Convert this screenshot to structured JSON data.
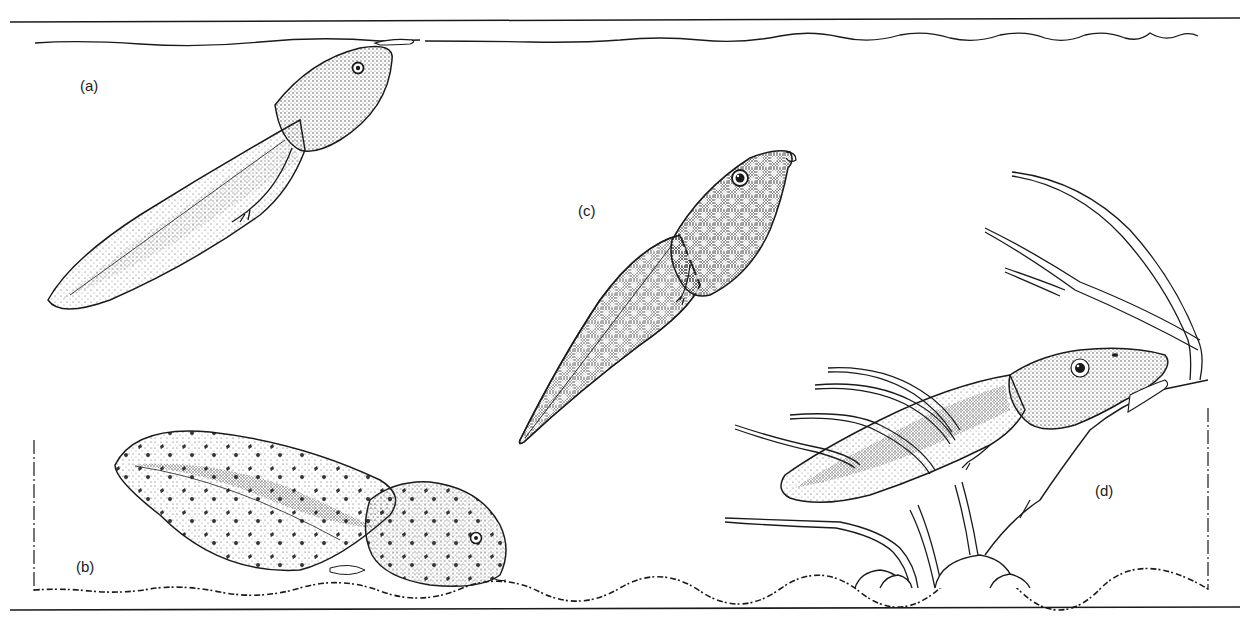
{
  "figure": {
    "labels": {
      "a": "(a)",
      "b": "(b)",
      "c": "(c)",
      "d": "(d)"
    },
    "panels": [
      {
        "id": "a",
        "subject": "tadpole-hanging-from-surface",
        "position": "upper-left"
      },
      {
        "id": "b",
        "subject": "tadpole-resting-on-bottom",
        "position": "lower-left"
      },
      {
        "id": "c",
        "subject": "tadpole-mid-water",
        "position": "center"
      },
      {
        "id": "d",
        "subject": "tadpole-clinging-to-rock-among-plants",
        "position": "lower-right"
      }
    ],
    "colors": {
      "ink": "#1a1a1a",
      "background": "#ffffff",
      "stipple": "#555555"
    }
  }
}
